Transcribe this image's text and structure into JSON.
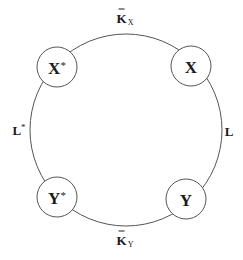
{
  "diagram": {
    "type": "cycle",
    "nodes": [
      {
        "id": "X_star",
        "label": "X",
        "superscript": "*"
      },
      {
        "id": "X",
        "label": "X",
        "superscript": ""
      },
      {
        "id": "Y",
        "label": "Y",
        "superscript": ""
      },
      {
        "id": "Y_star",
        "label": "Y",
        "superscript": "*"
      }
    ],
    "edges": [
      {
        "from": "X_star",
        "to": "X",
        "label": "K",
        "label_sub": "X",
        "label_accent": "tilde"
      },
      {
        "from": "X",
        "to": "Y",
        "label": "L",
        "label_sup": ""
      },
      {
        "from": "Y",
        "to": "Y_star",
        "label": "K",
        "label_sub": "Y",
        "label_accent": "tilde"
      },
      {
        "from": "Y_star",
        "to": "X_star",
        "label": "L",
        "label_sup": "*"
      }
    ]
  },
  "colors": {
    "stroke": "#555555",
    "text": "#1a1a1a",
    "background": "#ffffff"
  }
}
